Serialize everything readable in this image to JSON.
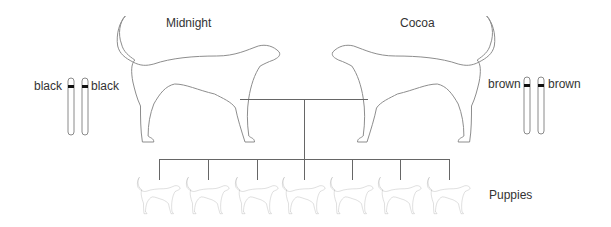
{
  "parents": [
    {
      "name": "Midnight",
      "alleles": [
        "black",
        "black"
      ]
    },
    {
      "name": "Cocoa",
      "alleles": [
        "brown",
        "brown"
      ]
    }
  ],
  "offspring": {
    "label": "Puppies",
    "count": 7
  },
  "colors": {
    "outline": "#8a8a8a",
    "line": "#666666",
    "band": "#111111",
    "text": "#333333"
  }
}
